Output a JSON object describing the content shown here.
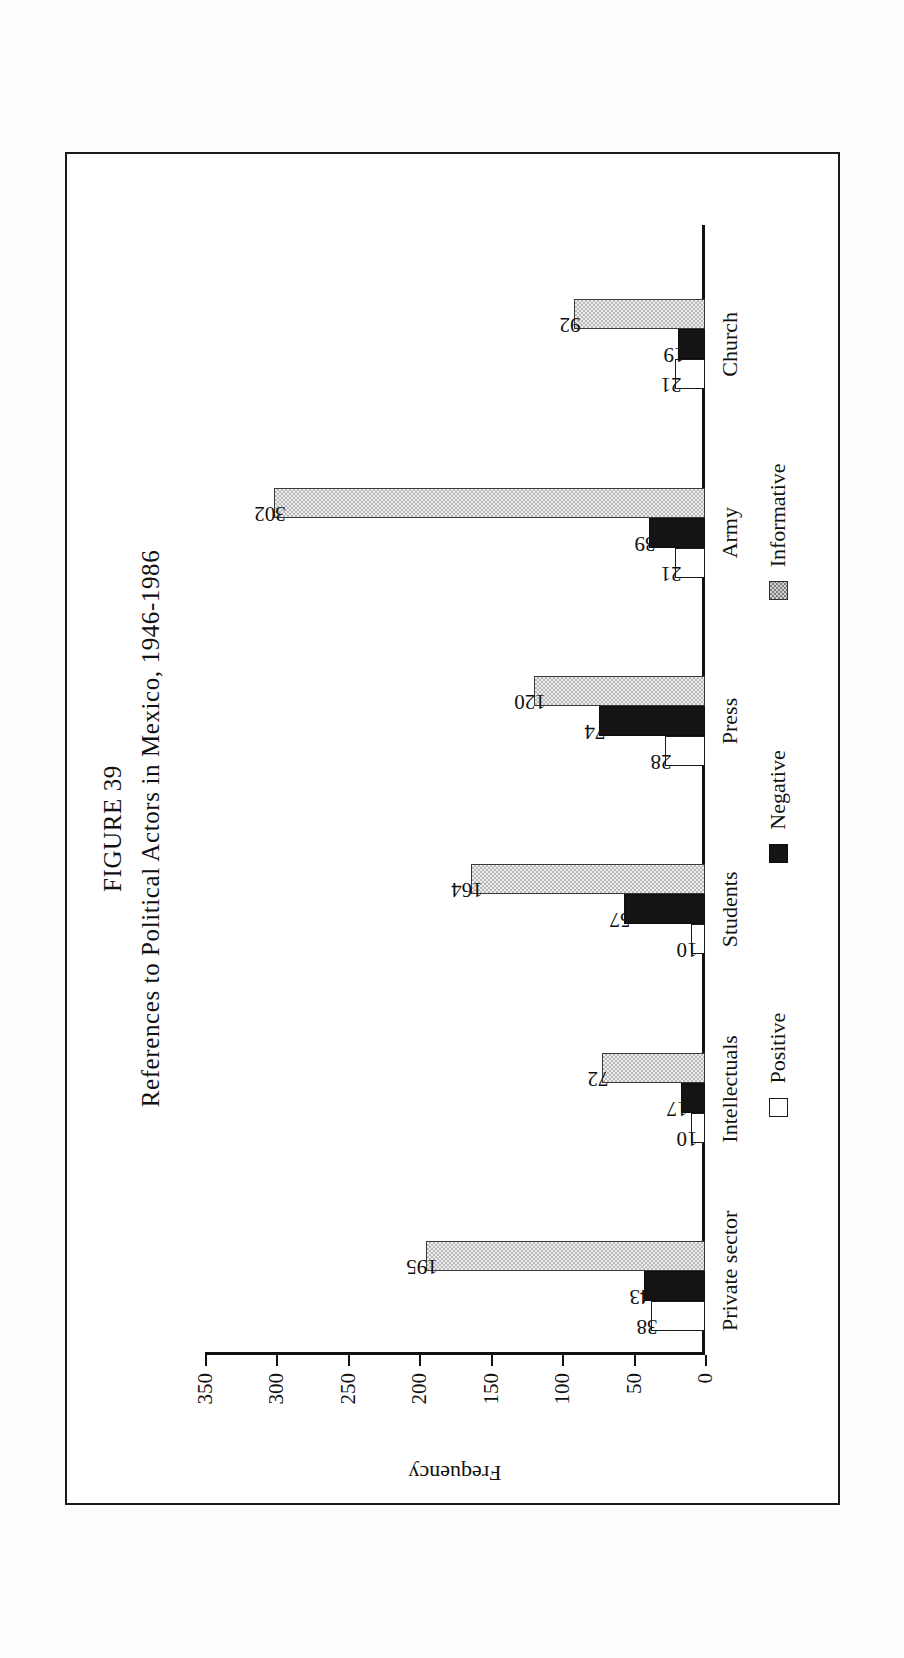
{
  "figure": {
    "number_label": "FIGURE 39",
    "title": "References to Political Actors in Mexico, 1946-1986"
  },
  "chart_data": {
    "type": "bar",
    "title": "References to Political Actors in Mexico, 1946-1986",
    "xlabel": "",
    "ylabel": "Frequency",
    "ylim": [
      0,
      350
    ],
    "yticks": [
      0,
      50,
      100,
      150,
      200,
      250,
      300,
      350
    ],
    "ytick_labels": [
      "0",
      "50",
      "100",
      "150",
      "200",
      "250",
      "300",
      "350"
    ],
    "grid": false,
    "orientation": "vertical-grouped",
    "rotation_on_page": "-90deg",
    "legend_position": "below-axis",
    "categories": [
      "Private sector",
      "Intellectuals",
      "Students",
      "Press",
      "Army",
      "Church"
    ],
    "series": [
      {
        "name": "Positive",
        "values": [
          38,
          10,
          10,
          28,
          21,
          21
        ],
        "color": "#ffffff",
        "edge": "#1b1b1b",
        "fill_style": "open"
      },
      {
        "name": "Negative",
        "values": [
          43,
          17,
          57,
          74,
          39,
          19
        ],
        "color": "#141414",
        "edge": "#0d0d0d",
        "fill_style": "solid"
      },
      {
        "name": "Informative",
        "values": [
          195,
          72,
          164,
          120,
          302,
          92
        ],
        "color": "#b9b9b9",
        "edge": "#3a3a3a",
        "fill_style": "stippled"
      }
    ]
  },
  "axis": {
    "y_title": "Frequency"
  },
  "legend": {
    "items": [
      {
        "label": "Positive",
        "style": "positive"
      },
      {
        "label": "Negative",
        "style": "negative"
      },
      {
        "label": "Informative",
        "style": "informative"
      }
    ]
  }
}
